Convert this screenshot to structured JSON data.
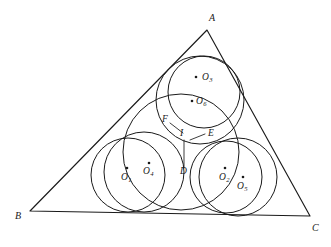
{
  "figure": {
    "background_color": "#ffffff",
    "stroke_color": "#1a1a1a",
    "width": 331,
    "height": 247
  },
  "triangle": {
    "name": "triangle-abc",
    "vertices": [
      {
        "label": "A",
        "x": 207,
        "y": 30,
        "label_x": 209,
        "label_y": 21
      },
      {
        "label": "B",
        "x": 30,
        "y": 211,
        "label_x": 15,
        "label_y": 219
      },
      {
        "label": "C",
        "x": 310,
        "y": 216,
        "label_x": 312,
        "label_y": 231
      }
    ]
  },
  "circles": [
    {
      "name": "circle-o1",
      "cx": 128,
      "cy": 175,
      "r": 37
    },
    {
      "name": "circle-o4",
      "cx": 144,
      "cy": 172,
      "r": 40
    },
    {
      "name": "circle-o2",
      "cx": 226,
      "cy": 177,
      "r": 36
    },
    {
      "name": "circle-o5",
      "cx": 238,
      "cy": 177,
      "r": 39
    },
    {
      "name": "circle-o3",
      "cx": 204,
      "cy": 92,
      "r": 36
    },
    {
      "name": "circle-o6",
      "cx": 200,
      "cy": 100,
      "r": 44
    },
    {
      "name": "circle-incircle",
      "cx": 181,
      "cy": 152,
      "r": 58
    }
  ],
  "points": [
    {
      "label": "O",
      "sub": "1",
      "dot_x": 127,
      "dot_y": 168,
      "label_x": 121,
      "label_y": 180
    },
    {
      "label": "O",
      "sub": "4",
      "dot_x": 149,
      "dot_y": 163,
      "label_x": 143,
      "label_y": 174
    },
    {
      "label": "O",
      "sub": "2",
      "dot_x": 225,
      "dot_y": 168,
      "label_x": 219,
      "label_y": 180
    },
    {
      "label": "O",
      "sub": "5",
      "dot_x": 243,
      "dot_y": 177,
      "label_x": 237,
      "label_y": 189
    },
    {
      "label": "O",
      "sub": "3",
      "dot_x": 196,
      "dot_y": 77,
      "label_x": 202,
      "label_y": 80
    },
    {
      "label": "O",
      "sub": "6",
      "dot_x": 192,
      "dot_y": 101,
      "label_x": 196,
      "label_y": 104
    }
  ],
  "annotations": [
    {
      "label": "I",
      "label_x": 180,
      "label_y": 136,
      "name": "point-label-i"
    },
    {
      "label": "D",
      "label_x": 180,
      "label_y": 174,
      "name": "point-label-d"
    },
    {
      "label": "E",
      "label_x": 208,
      "label_y": 136,
      "name": "point-label-e"
    },
    {
      "label": "F",
      "label_x": 162,
      "label_y": 122,
      "name": "point-label-f"
    }
  ],
  "leaders": [
    {
      "name": "leader-f",
      "x1": 170,
      "y1": 123,
      "x2": 183,
      "y2": 133
    },
    {
      "name": "leader-e",
      "x1": 205,
      "y1": 134,
      "x2": 190,
      "y2": 140
    },
    {
      "name": "leader-i-to-d",
      "x1": 184,
      "y1": 140,
      "x2": 184,
      "y2": 168
    }
  ]
}
